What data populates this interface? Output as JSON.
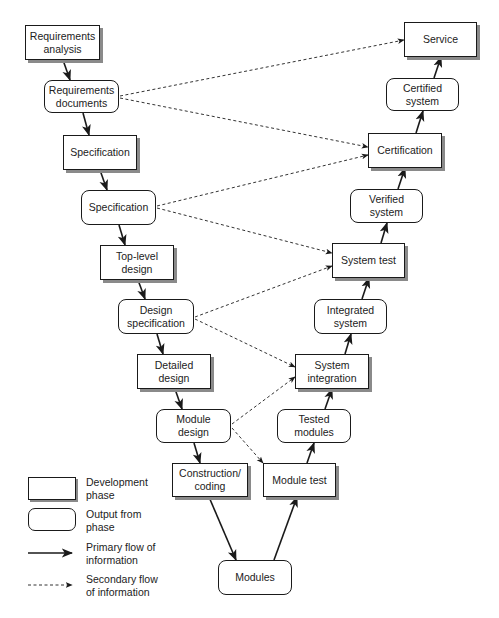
{
  "diagram": {
    "type": "V-model software development lifecycle",
    "nodes": [
      {
        "id": "req_analysis",
        "label": "Requirements analysis",
        "kind": "phase"
      },
      {
        "id": "req_docs",
        "label": "Requirements documents",
        "kind": "output"
      },
      {
        "id": "spec_phase",
        "label": "Specification",
        "kind": "phase"
      },
      {
        "id": "spec_out",
        "label": "Specification",
        "kind": "output"
      },
      {
        "id": "top_design",
        "label": "Top-level design",
        "kind": "phase"
      },
      {
        "id": "design_spec",
        "label": "Design specification",
        "kind": "output"
      },
      {
        "id": "detailed_design",
        "label": "Detailed design",
        "kind": "phase"
      },
      {
        "id": "module_design",
        "label": "Module design",
        "kind": "output"
      },
      {
        "id": "construction",
        "label": "Construction/ coding",
        "kind": "phase"
      },
      {
        "id": "modules",
        "label": "Modules",
        "kind": "output"
      },
      {
        "id": "module_test",
        "label": "Module test",
        "kind": "phase"
      },
      {
        "id": "tested_modules",
        "label": "Tested modules",
        "kind": "output"
      },
      {
        "id": "sys_integration",
        "label": "System integration",
        "kind": "phase"
      },
      {
        "id": "integrated_system",
        "label": "Integrated system",
        "kind": "output"
      },
      {
        "id": "system_test",
        "label": "System test",
        "kind": "phase"
      },
      {
        "id": "verified_system",
        "label": "Verified system",
        "kind": "output"
      },
      {
        "id": "certification",
        "label": "Certification",
        "kind": "phase"
      },
      {
        "id": "certified_system",
        "label": "Certified system",
        "kind": "output"
      },
      {
        "id": "service",
        "label": "Service",
        "kind": "phase"
      }
    ],
    "primary_edges": [
      [
        "req_analysis",
        "req_docs"
      ],
      [
        "req_docs",
        "spec_phase"
      ],
      [
        "spec_phase",
        "spec_out"
      ],
      [
        "spec_out",
        "top_design"
      ],
      [
        "top_design",
        "design_spec"
      ],
      [
        "design_spec",
        "detailed_design"
      ],
      [
        "detailed_design",
        "module_design"
      ],
      [
        "module_design",
        "construction"
      ],
      [
        "construction",
        "modules"
      ],
      [
        "modules",
        "module_test"
      ],
      [
        "module_test",
        "tested_modules"
      ],
      [
        "tested_modules",
        "sys_integration"
      ],
      [
        "sys_integration",
        "integrated_system"
      ],
      [
        "integrated_system",
        "system_test"
      ],
      [
        "system_test",
        "verified_system"
      ],
      [
        "verified_system",
        "certification"
      ],
      [
        "certification",
        "certified_system"
      ],
      [
        "certified_system",
        "service"
      ]
    ],
    "secondary_edges": [
      [
        "req_docs",
        "service"
      ],
      [
        "req_docs",
        "certification"
      ],
      [
        "spec_out",
        "certification"
      ],
      [
        "spec_out",
        "system_test"
      ],
      [
        "design_spec",
        "system_test"
      ],
      [
        "design_spec",
        "sys_integration"
      ],
      [
        "module_design",
        "sys_integration"
      ],
      [
        "module_design",
        "module_test"
      ]
    ]
  },
  "legend": {
    "phase": "Development phase",
    "output": "Output from phase",
    "primary": "Primary flow of information",
    "secondary": "Secondary flow of information"
  },
  "colors": {
    "line": "#1a1a1a",
    "shadow": "#8a8a8a",
    "background": "#ffffff"
  }
}
